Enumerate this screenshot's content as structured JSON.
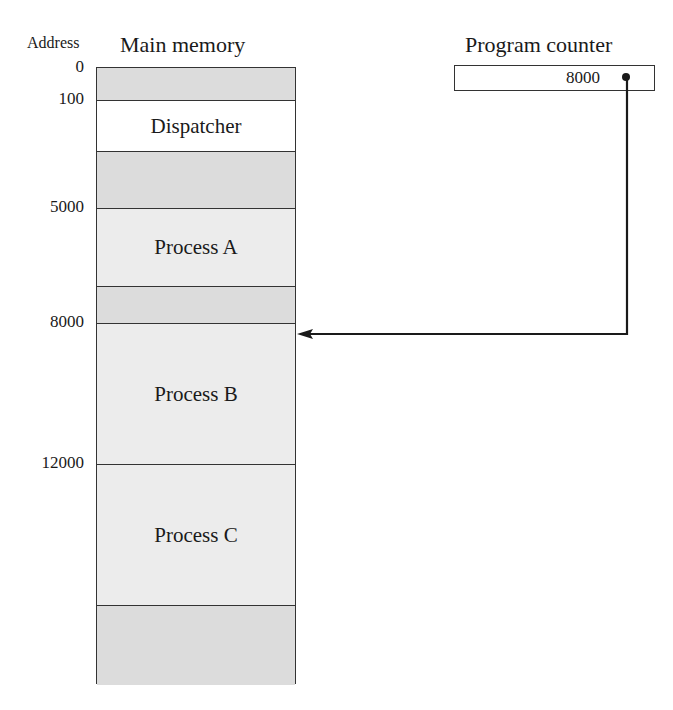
{
  "headers": {
    "address": "Address",
    "main_memory": "Main memory",
    "program_counter": "Program counter"
  },
  "program_counter": {
    "value": "8000"
  },
  "addresses": [
    {
      "label": "0",
      "y": 58
    },
    {
      "label": "100",
      "y": 90
    },
    {
      "label": "5000",
      "y": 198
    },
    {
      "label": "8000",
      "y": 313
    },
    {
      "label": "12000",
      "y": 454
    }
  ],
  "segments": [
    {
      "label": "",
      "shade": "dark"
    },
    {
      "label": "Dispatcher",
      "shade": "white"
    },
    {
      "label": "",
      "shade": "dark"
    },
    {
      "label": "Process A",
      "shade": "light"
    },
    {
      "label": "",
      "shade": "dark"
    },
    {
      "label": "Process B",
      "shade": "light"
    },
    {
      "label": "Process C",
      "shade": "light"
    },
    {
      "label": "",
      "shade": "dark"
    }
  ]
}
